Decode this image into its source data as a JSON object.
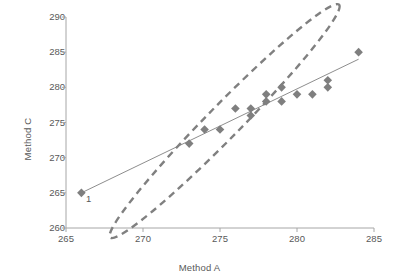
{
  "chart_data": {
    "type": "scatter",
    "title": "",
    "xlabel": "Method A",
    "ylabel": "Method C",
    "xlim": [
      265,
      285
    ],
    "ylim": [
      260,
      290
    ],
    "xticks": [
      265,
      270,
      275,
      280,
      285
    ],
    "yticks": [
      260,
      265,
      270,
      275,
      280,
      285,
      290
    ],
    "grid": false,
    "legend": null,
    "marker": "diamond",
    "marker_color": "#7f7f7f",
    "points": [
      {
        "x": 266,
        "y": 265
      },
      {
        "x": 273,
        "y": 272
      },
      {
        "x": 274,
        "y": 274
      },
      {
        "x": 275,
        "y": 274
      },
      {
        "x": 276,
        "y": 277
      },
      {
        "x": 277,
        "y": 276
      },
      {
        "x": 277,
        "y": 277
      },
      {
        "x": 278,
        "y": 278
      },
      {
        "x": 278,
        "y": 279
      },
      {
        "x": 279,
        "y": 278
      },
      {
        "x": 279,
        "y": 280
      },
      {
        "x": 280,
        "y": 279
      },
      {
        "x": 281,
        "y": 279
      },
      {
        "x": 282,
        "y": 280
      },
      {
        "x": 282,
        "y": 281
      },
      {
        "x": 284,
        "y": 285
      }
    ],
    "trendline": {
      "type": "line",
      "color": "#808080",
      "from": {
        "x": 266,
        "y": 265
      },
      "to": {
        "x": 284,
        "y": 284
      }
    },
    "ellipse": {
      "style": "dashed",
      "color": "#808080",
      "center": {
        "x": 275.3,
        "y": 275.2
      },
      "semi_major": 10.6,
      "semi_minor": 2.35,
      "rotation_deg": -45.5
    },
    "annotations": [
      {
        "label": "1",
        "x": 266.3,
        "y": 263.7
      }
    ]
  },
  "axis": {
    "x_label": "Method A",
    "y_label": "Method C",
    "x_tick_labels": [
      "265",
      "270",
      "275",
      "280",
      "285"
    ],
    "y_tick_labels": [
      "260",
      "265",
      "270",
      "275",
      "280",
      "285",
      "290"
    ]
  },
  "colors": {
    "marker": "#7f7f7f",
    "ellipse": "#808080",
    "trendline": "#808080",
    "axis": "#a6a6a6",
    "text": "#595959"
  }
}
